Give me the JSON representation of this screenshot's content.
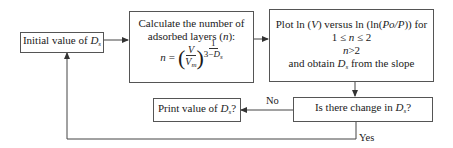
{
  "diagram": {
    "type": "flowchart",
    "nodes": {
      "initial": {
        "text_prefix": "Initial value of ",
        "var": "D",
        "sub": "s"
      },
      "calculate": {
        "line1": "Calculate the number of",
        "line2_prefix": "adsorbed layers (",
        "line2_var": "n",
        "line2_suffix": "):",
        "eq_lhs": "n",
        "eq_sign": "=",
        "frac_num": "V",
        "frac_den": "V",
        "frac_den_sub": "m",
        "exp_num": "1",
        "exp_den_prefix": "3−",
        "exp_den_var": "D",
        "exp_den_sub": "s"
      },
      "plot": {
        "line1_a": "Plot ln (",
        "line1_v": "V",
        "line1_b": ") versus ln (ln(",
        "line1_p": "Po/P",
        "line1_c": ")) for",
        "line2_a": "1 ≤ ",
        "line2_n": "n",
        "line2_b": " ≤ 2",
        "line3_n": "n",
        "line3_b": ">2",
        "line4_a": "and obtain ",
        "line4_var": "D",
        "line4_sub": "s",
        "line4_b": " from the slope"
      },
      "decision": {
        "text_prefix": "Is there change in ",
        "var": "D",
        "sub": "s",
        "suffix": "?"
      },
      "print": {
        "text_prefix": "Print value of ",
        "var": "D",
        "sub": "s",
        "suffix": "?"
      }
    },
    "edges": {
      "no_label": "No",
      "yes_label": "Yes"
    },
    "colors": {
      "line": "#444444",
      "border": "#555555",
      "text": "#1a1a1a",
      "background": "#ffffff"
    }
  }
}
